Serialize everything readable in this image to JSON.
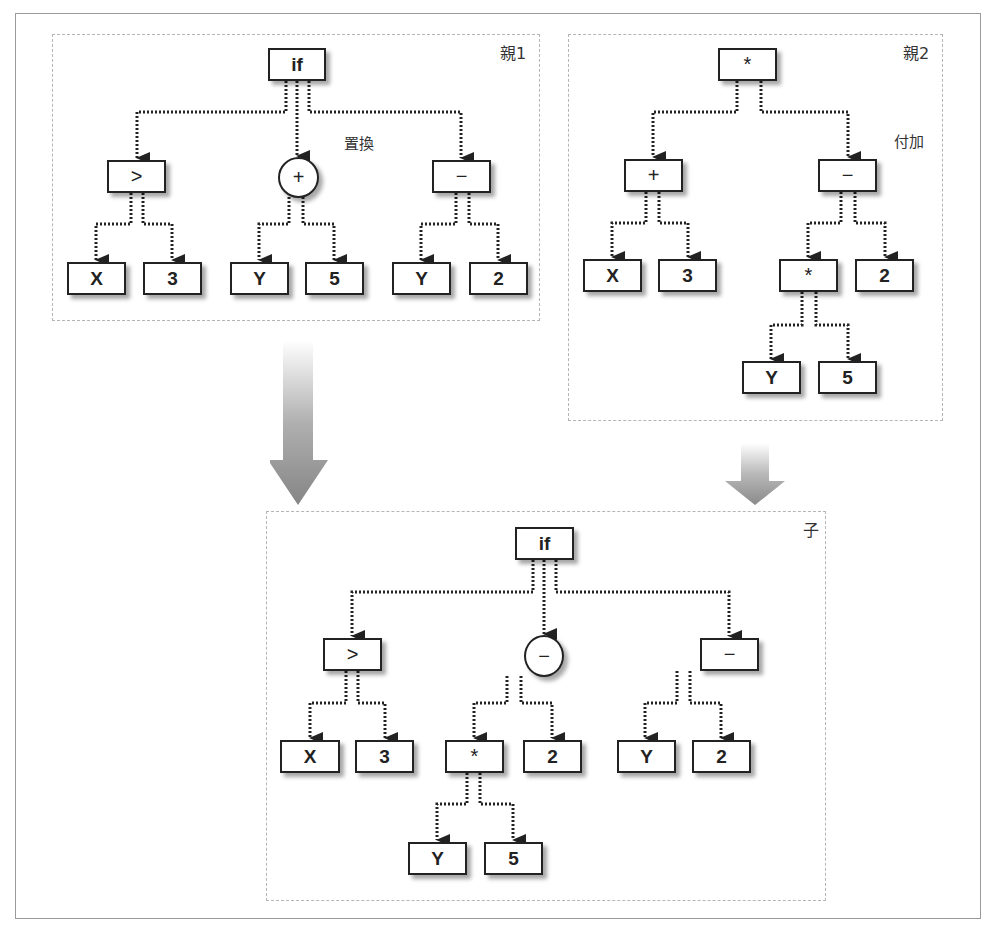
{
  "panels": {
    "parent1": {
      "label": "親1",
      "annotation": "置換",
      "nodes": {
        "root": "if",
        "gt": ">",
        "plus": "+",
        "minus": "−",
        "x": "X",
        "three": "3",
        "y1": "Y",
        "five": "5",
        "y2": "Y",
        "two": "2"
      }
    },
    "parent2": {
      "label": "親2",
      "annotation": "付加",
      "nodes": {
        "root": "*",
        "plus": "+",
        "minus": "−",
        "x": "X",
        "three": "3",
        "mul": "*",
        "two": "2",
        "y": "Y",
        "five": "5"
      }
    },
    "child": {
      "label": "子",
      "nodes": {
        "root": "if",
        "gt": ">",
        "minus_circle": "−",
        "minus": "−",
        "x": "X",
        "three": "3",
        "mul": "*",
        "two1": "2",
        "y1": "Y",
        "two2": "2",
        "y2": "Y",
        "five": "5"
      }
    }
  },
  "colors": {
    "node_border": "#222222",
    "panel_border": "#b5b5b5",
    "arrow_gradient_top": "#ffffff",
    "arrow_gradient_bottom": "#8a8a8a"
  }
}
